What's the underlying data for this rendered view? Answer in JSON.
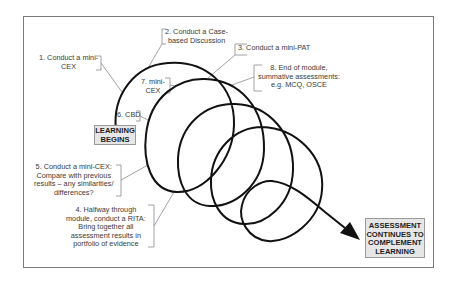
{
  "diagram": {
    "type": "spiral-flow",
    "start_box": {
      "line1": "LEARNING",
      "line2": "BEGINS"
    },
    "end_box": {
      "line1": "ASSESSMENT",
      "line2": "CONTINUES TO",
      "line3": "COMPLEMENT",
      "line4": "LEARNING"
    },
    "steps": [
      {
        "id": 1,
        "lines": [
          "1. Conduct a mini-",
          "CEX"
        ]
      },
      {
        "id": 2,
        "lines": [
          "2. Conduct a Case-",
          "based Discussion"
        ]
      },
      {
        "id": 3,
        "lines": [
          "3. Conduct a mini-PAT"
        ]
      },
      {
        "id": 4,
        "lines": [
          "4. Halfway through",
          "module, conduct a RITA:",
          "Bring together all",
          "assessment results in",
          "portfolio of evidence"
        ]
      },
      {
        "id": 5,
        "lines": [
          "5. Conduct a mini-CEX:",
          "Compare with previous",
          "results – any similarities/",
          "differences?"
        ]
      },
      {
        "id": 6,
        "lines": [
          "6. CBD"
        ]
      },
      {
        "id": 7,
        "lines": [
          "7. mini-",
          "CEX"
        ]
      },
      {
        "id": 8,
        "lines": [
          "8. End of module,",
          "summative assessments:",
          "e.g. MCQ, OSCE"
        ]
      }
    ],
    "colors": {
      "line": "#111111",
      "leader": "#8a8a8a",
      "box_fill": "#e6e6e6",
      "frame": "#7a7a7a"
    }
  }
}
